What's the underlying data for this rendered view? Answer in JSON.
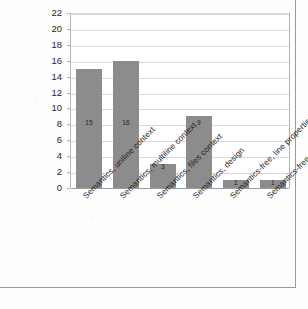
{
  "chart_data": {
    "type": "bar",
    "title": "",
    "subtitle": "",
    "xlabel": "",
    "ylabel": "",
    "ylim": [
      0,
      22
    ],
    "ytick_step": 2,
    "yticks": [
      22,
      20,
      18,
      16,
      14,
      12,
      10,
      8,
      6,
      4,
      2,
      0
    ],
    "grid": true,
    "legend": "none",
    "categories": [
      "Semantics, uniline context",
      "Semantics, multiline context",
      "Semantics, files context",
      "Semantics, design",
      "Semantics-free, line properties",
      "Semantics-free, keyword"
    ],
    "values": [
      15,
      16,
      3,
      9,
      1,
      1
    ],
    "data_labels": [
      "15",
      "16",
      "3",
      "9",
      "1",
      "1"
    ],
    "bar_color": "#8c8c8c",
    "gridline_color": "#d9d9d9",
    "axis_color": "#9d9d9d",
    "plot_background": "#ffffff",
    "page_background": "#fdfdfd",
    "frame_color": "#9a9a9a",
    "label_rotation_degrees": -45
  }
}
